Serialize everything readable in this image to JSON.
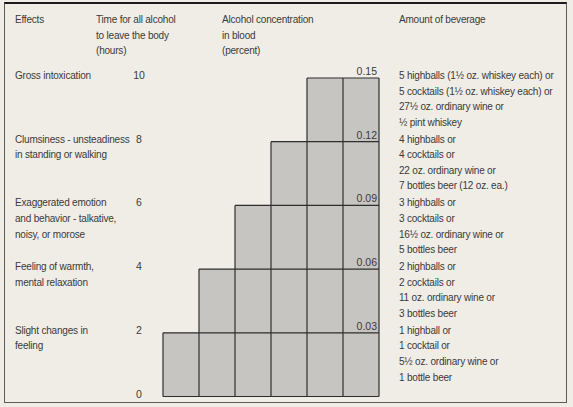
{
  "figure": {
    "headers": {
      "effects": "Effects",
      "time": [
        "Time for all alcohol",
        "to leave the body",
        "(hours)"
      ],
      "concentration": [
        "Alcohol concentration",
        "in blood",
        "(percent)"
      ],
      "amount": "Amount of beverage"
    }
  },
  "chart_data": {
    "type": "bar",
    "subtype": "staircase-step-chart",
    "title": "",
    "hours_axis_label": "Time for all alcohol to leave the body (hours)",
    "percent_axis_label": "Alcohol concentration in blood (percent)",
    "hours_ticks": [
      0,
      2,
      4,
      6,
      8,
      10
    ],
    "percent_ticks": [
      0.03,
      0.06,
      0.09,
      0.12,
      0.15
    ],
    "column_count": 6,
    "column_top_hours": [
      2,
      4,
      6,
      8,
      10,
      10
    ],
    "baseline_label": "0",
    "rows": [
      {
        "effect_lines": [
          "Gross intoxication"
        ],
        "hours": 10,
        "percent_label": "0.15",
        "beverage_lines": [
          "5 highballs (1½ oz. whiskey each) or",
          "5 cocktails (1½ oz. whiskey each) or",
          "27½ oz. ordinary wine or",
          "½ pint whiskey"
        ]
      },
      {
        "effect_lines": [
          "Clumsiness - unsteadiness",
          "in standing or walking"
        ],
        "hours": 8,
        "percent_label": "0.12",
        "beverage_lines": [
          "4 highballs or",
          "4 cocktails or",
          "22 oz. ordinary wine or",
          "7 bottles beer (12 oz. ea.)"
        ]
      },
      {
        "effect_lines": [
          "Exaggerated emotion",
          "and behavior - talkative,",
          "noisy, or morose"
        ],
        "hours": 6,
        "percent_label": "0.09",
        "beverage_lines": [
          "3 highballs or",
          "3 cocktails or",
          "16½ oz. ordinary wine or",
          "5 bottles beer"
        ]
      },
      {
        "effect_lines": [
          "Feeling of warmth,",
          "mental relaxation"
        ],
        "hours": 4,
        "percent_label": "0.06",
        "beverage_lines": [
          "2 highballs or",
          "2 cocktails or",
          "11 oz. ordinary wine or",
          "3 bottles beer"
        ]
      },
      {
        "effect_lines": [
          "Slight changes in",
          "feeling"
        ],
        "hours": 2,
        "percent_label": "0.03",
        "beverage_lines": [
          "1 highball or",
          "1 cocktail or",
          "5½ oz. ordinary wine or",
          "1 bottle beer"
        ]
      }
    ],
    "colors": {
      "background": "#f0ede6",
      "bar_fill": "#c6c5c1",
      "line": "#2e2e2e",
      "text": "#3a3a3a"
    }
  }
}
